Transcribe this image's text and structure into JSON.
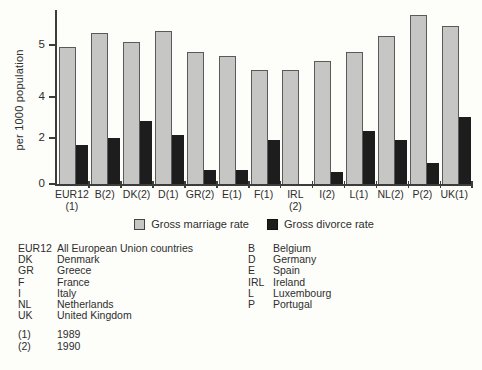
{
  "chart_data": {
    "type": "bar",
    "ylabel": "per 1000 population",
    "ylim": [
      0,
      7.5
    ],
    "scale_max": 7.5,
    "grid": false,
    "legend_position": "bottom",
    "y_ticks": [
      {
        "label": "0",
        "frac": 0.0
      },
      {
        "label": "2",
        "frac": 0.264
      },
      {
        "label": "4",
        "frac": 0.5
      },
      {
        "label": "5",
        "frac": 0.8
      }
    ],
    "categories": [
      {
        "label": "EUR12",
        "sub": "(1)"
      },
      {
        "label": "B(2)",
        "sub": ""
      },
      {
        "label": "DK(2)",
        "sub": ""
      },
      {
        "label": "D(1)",
        "sub": ""
      },
      {
        "label": "GR(2)",
        "sub": ""
      },
      {
        "label": "E(1)",
        "sub": ""
      },
      {
        "label": "F(1)",
        "sub": ""
      },
      {
        "label": "IRL",
        "sub": "(2)"
      },
      {
        "label": "I(2)",
        "sub": ""
      },
      {
        "label": "L(1)",
        "sub": ""
      },
      {
        "label": "NL(2)",
        "sub": ""
      },
      {
        "label": "P(2)",
        "sub": ""
      },
      {
        "label": "UK(1)",
        "sub": ""
      }
    ],
    "series": [
      {
        "name": "Gross marriage rate",
        "color": "#c6c7c4",
        "values": [
          5.9,
          6.5,
          6.1,
          6.6,
          5.7,
          5.5,
          4.9,
          4.9,
          5.3,
          5.7,
          6.4,
          7.3,
          6.8
        ]
      },
      {
        "name": "Gross divorce rate",
        "color": "#1d1d1d",
        "values": [
          1.7,
          2.0,
          2.7,
          2.1,
          0.6,
          0.6,
          1.9,
          0.0,
          0.5,
          2.3,
          1.9,
          0.9,
          2.9
        ]
      }
    ]
  },
  "key": {
    "columns": [
      {
        "entries": [
          {
            "term": "EUR12",
            "def": "All European Union countries"
          },
          {
            "term": "DK",
            "def": "Denmark"
          },
          {
            "term": "GR",
            "def": "Greece"
          },
          {
            "term": "F",
            "def": "France"
          },
          {
            "term": "I",
            "def": "Italy"
          },
          {
            "term": "NL",
            "def": "Netherlands"
          },
          {
            "term": "UK",
            "def": "United Kingdom"
          }
        ]
      },
      {
        "entries": [
          {
            "term": "B",
            "def": "Belgium"
          },
          {
            "term": "D",
            "def": "Germany"
          },
          {
            "term": "E",
            "def": "Spain"
          },
          {
            "term": "IRL",
            "def": "Ireland"
          },
          {
            "term": "L",
            "def": "Luxembourg"
          },
          {
            "term": "P",
            "def": "Portugal"
          }
        ]
      }
    ],
    "notes": [
      {
        "term": "(1)",
        "def": "1989"
      },
      {
        "term": "(2)",
        "def": "1990"
      }
    ]
  }
}
